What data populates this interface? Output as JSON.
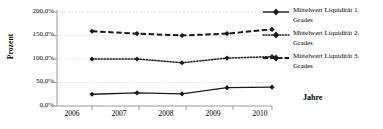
{
  "chart_data": {
    "type": "line",
    "title": "",
    "xlabel": "Jahre",
    "ylabel": "Prozent",
    "categories": [
      "2006",
      "2007",
      "2008",
      "2009",
      "2010"
    ],
    "x": [
      2006,
      2007,
      2008,
      2009,
      2010
    ],
    "ylim": [
      0,
      200
    ],
    "xlim": [
      2006,
      2010
    ],
    "y_tick_labels": [
      "0,0%",
      "50,0%",
      "100,0%",
      "150,0%",
      "200,0%"
    ],
    "y_ticks": [
      0,
      50,
      100,
      150,
      200
    ],
    "grid": true,
    "grid_axis": "y",
    "legend_position": "right",
    "series": [
      {
        "name": "Mittelwert Liquidität 1. Grades",
        "name_line1": "Mittelwert Liquidität 1.",
        "name_line2": "Grades",
        "values": [
          25.0,
          28.0,
          26.0,
          39.0,
          40.0
        ],
        "line_style": "solid",
        "marker": "diamond",
        "color": "#1a1a1a"
      },
      {
        "name": "Mittelwert Liquidität 2. Grades",
        "name_line1": "Mittelwert Liquidität 2.",
        "name_line2": "Grades",
        "values": [
          100.0,
          100.0,
          92.0,
          102.0,
          105.0
        ],
        "line_style": "dotted",
        "marker": "diamond",
        "color": "#1a1a1a"
      },
      {
        "name": "Mittelwert Liquidität 3. Grades",
        "name_line1": "Mittelwert Liquidität 3.",
        "name_line2": "Grades",
        "values": [
          159.0,
          154.0,
          150.0,
          154.0,
          163.0
        ],
        "line_style": "dashed",
        "marker": "diamond",
        "color": "#1a1a1a"
      }
    ],
    "colors": {
      "axis": "#808080",
      "grid": "#d0d0d0",
      "series": "#1a1a1a",
      "background": "#ffffff"
    }
  }
}
